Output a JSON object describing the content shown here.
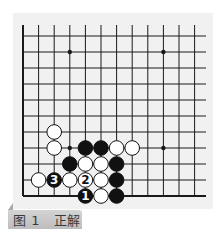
{
  "caption": {
    "figure": "图 1",
    "label": "正解",
    "text": "图 1   正解"
  },
  "board": {
    "columns": 12,
    "rows": 11,
    "origin_x": 23,
    "origin_y": 36,
    "spacing_x": 15.6,
    "spacing_y": 16,
    "top_extend_y": 25,
    "right_extend_x": 206,
    "line_color": "#1a1a1a",
    "star_points": [
      [
        3,
        1
      ],
      [
        9,
        1
      ],
      [
        3,
        7
      ],
      [
        9,
        7
      ]
    ],
    "stones": [
      {
        "col": 2,
        "row": 6,
        "color": "white"
      },
      {
        "col": 2,
        "row": 7,
        "color": "white"
      },
      {
        "col": 4,
        "row": 7,
        "color": "black"
      },
      {
        "col": 5,
        "row": 7,
        "color": "black"
      },
      {
        "col": 6,
        "row": 7,
        "color": "white"
      },
      {
        "col": 7,
        "row": 7,
        "color": "white"
      },
      {
        "col": 3,
        "row": 8,
        "color": "black"
      },
      {
        "col": 4,
        "row": 8,
        "color": "white"
      },
      {
        "col": 5,
        "row": 8,
        "color": "white"
      },
      {
        "col": 6,
        "row": 8,
        "color": "black"
      },
      {
        "col": 1,
        "row": 9,
        "color": "white"
      },
      {
        "col": 2,
        "row": 9,
        "color": "black",
        "label": "3"
      },
      {
        "col": 3,
        "row": 9,
        "color": "white"
      },
      {
        "col": 4,
        "row": 9,
        "color": "white",
        "label": "2"
      },
      {
        "col": 5,
        "row": 9,
        "color": "white"
      },
      {
        "col": 6,
        "row": 9,
        "color": "black"
      },
      {
        "col": 4,
        "row": 10,
        "color": "black",
        "label": "1"
      },
      {
        "col": 5,
        "row": 10,
        "color": "white"
      },
      {
        "col": 6,
        "row": 10,
        "color": "black"
      }
    ]
  }
}
